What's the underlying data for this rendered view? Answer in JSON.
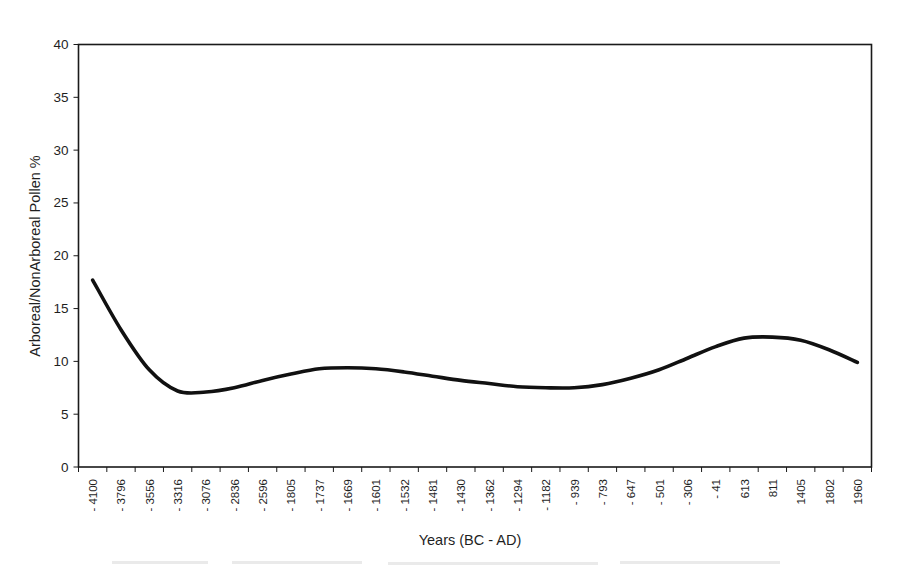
{
  "chart_data": {
    "type": "line",
    "title": "",
    "xlabel": "Years (BC - AD)",
    "ylabel": "Arboreal/NonArboreal Pollen %",
    "ylim": [
      0,
      40
    ],
    "ytick_labels": [
      "0",
      "5",
      "10",
      "15",
      "20",
      "25",
      "30",
      "35",
      "40"
    ],
    "ytick_values": [
      0,
      5,
      10,
      15,
      20,
      25,
      30,
      35,
      40
    ],
    "grid": false,
    "legend": "none",
    "line_color": "#111111",
    "line_width": 3.6,
    "categories": [
      "-4100",
      "-3796",
      "-3556",
      "-3316",
      "-3076",
      "-2836",
      "-2596",
      "-1805",
      "-1737",
      "-1669",
      "-1601",
      "-1532",
      "-1481",
      "-1430",
      "-1362",
      "-1294",
      "-1182",
      "-939",
      "-793",
      "-647",
      "-501",
      "-306",
      "-41",
      "613",
      "811",
      "1405",
      "1802",
      "1960"
    ],
    "values": [
      17.7,
      13.0,
      9.2,
      7.2,
      7.1,
      7.5,
      8.2,
      8.8,
      9.3,
      9.4,
      9.3,
      9.0,
      8.6,
      8.2,
      7.9,
      7.6,
      7.5,
      7.5,
      7.8,
      8.4,
      9.2,
      10.3,
      11.4,
      12.2,
      12.3,
      12.0,
      11.1,
      9.9
    ],
    "series": [
      {
        "name": "Arboreal/NonArboreal Pollen %",
        "values": [
          17.7,
          13.0,
          9.2,
          7.2,
          7.1,
          7.5,
          8.2,
          8.8,
          9.3,
          9.4,
          9.3,
          9.0,
          8.6,
          8.2,
          7.9,
          7.6,
          7.5,
          7.5,
          7.8,
          8.4,
          9.2,
          10.3,
          11.4,
          12.2,
          12.3,
          12.0,
          11.1,
          9.9
        ]
      }
    ]
  }
}
